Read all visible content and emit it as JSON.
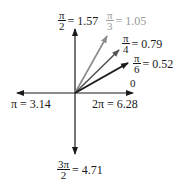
{
  "diagram": {
    "origin": {
      "x": 75,
      "y": 93
    },
    "colors": {
      "axis": "#1a1a1a",
      "pi_over_6": "#1a1a1a",
      "pi_over_4": "#555555",
      "pi_over_3": "#8a8a8a",
      "pi_over_3_label": "#9a9a9a"
    },
    "axes": [
      {
        "name": "positive-x",
        "angle": "0 / 2π",
        "tip": {
          "x": 133,
          "y": 93
        }
      },
      {
        "name": "positive-y",
        "angle": "π/2",
        "tip": {
          "x": 75,
          "y": 29
        }
      },
      {
        "name": "negative-x",
        "angle": "π",
        "tip": {
          "x": 17,
          "y": 93
        }
      },
      {
        "name": "negative-y",
        "angle": "3π/2",
        "tip": {
          "x": 75,
          "y": 154
        }
      }
    ],
    "vectors": [
      {
        "angle": "π/6",
        "tip": {
          "x": 128,
          "y": 63
        }
      },
      {
        "angle": "π/4",
        "tip": {
          "x": 119,
          "y": 50
        }
      },
      {
        "angle": "π/3",
        "tip": {
          "x": 107,
          "y": 36
        }
      }
    ],
    "labels": {
      "pi_over_2": {
        "num": "π",
        "den": "2",
        "value": "= 1.57"
      },
      "pi_over_3": {
        "num": "π",
        "den": "3",
        "value": "= 1.05"
      },
      "pi_over_4": {
        "num": "π",
        "den": "4",
        "value": "= 0.79"
      },
      "pi_over_6": {
        "num": "π",
        "den": "6",
        "value": "= 0.52"
      },
      "zero": {
        "text": "0"
      },
      "pi": {
        "text": "π = 3.14"
      },
      "two_pi": {
        "text": "2π = 6.28"
      },
      "three_pi_over_2": {
        "num": "3π",
        "den": "2",
        "value": "= 4.71"
      }
    }
  }
}
